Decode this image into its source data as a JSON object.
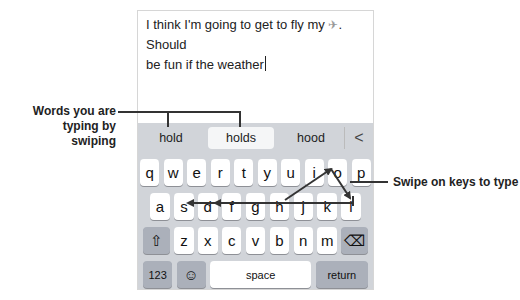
{
  "message": {
    "line1_before": "I think I'm going to get to fly my ",
    "emoji": "✈",
    "line1_after": ". Should",
    "line2": "be fun if the weather"
  },
  "predictions": {
    "items": [
      "hold",
      "holds",
      "hood"
    ],
    "selected_index": 1,
    "back_glyph": "<"
  },
  "keyboard": {
    "row1": [
      "q",
      "w",
      "e",
      "r",
      "t",
      "y",
      "u",
      "i",
      "o",
      "p"
    ],
    "row2": [
      "a",
      "s",
      "d",
      "f",
      "g",
      "h",
      "j",
      "k",
      "l"
    ],
    "row3": [
      "z",
      "x",
      "c",
      "v",
      "b",
      "n",
      "m"
    ],
    "shift_glyph": "⇧",
    "delete_glyph": "⌫",
    "numbers_label": "123",
    "emoji_glyph": "☺",
    "space_label": "space",
    "return_label": "return"
  },
  "callouts": {
    "left_line1": "Words you are",
    "left_line2": "typing by swiping",
    "right": "Swipe on keys to type"
  },
  "colors": {
    "keyboard_bg": "#d1d4d9",
    "key_bg": "#ffffff",
    "modifier_key_bg": "#abb0ba",
    "annotation": "#333333"
  }
}
